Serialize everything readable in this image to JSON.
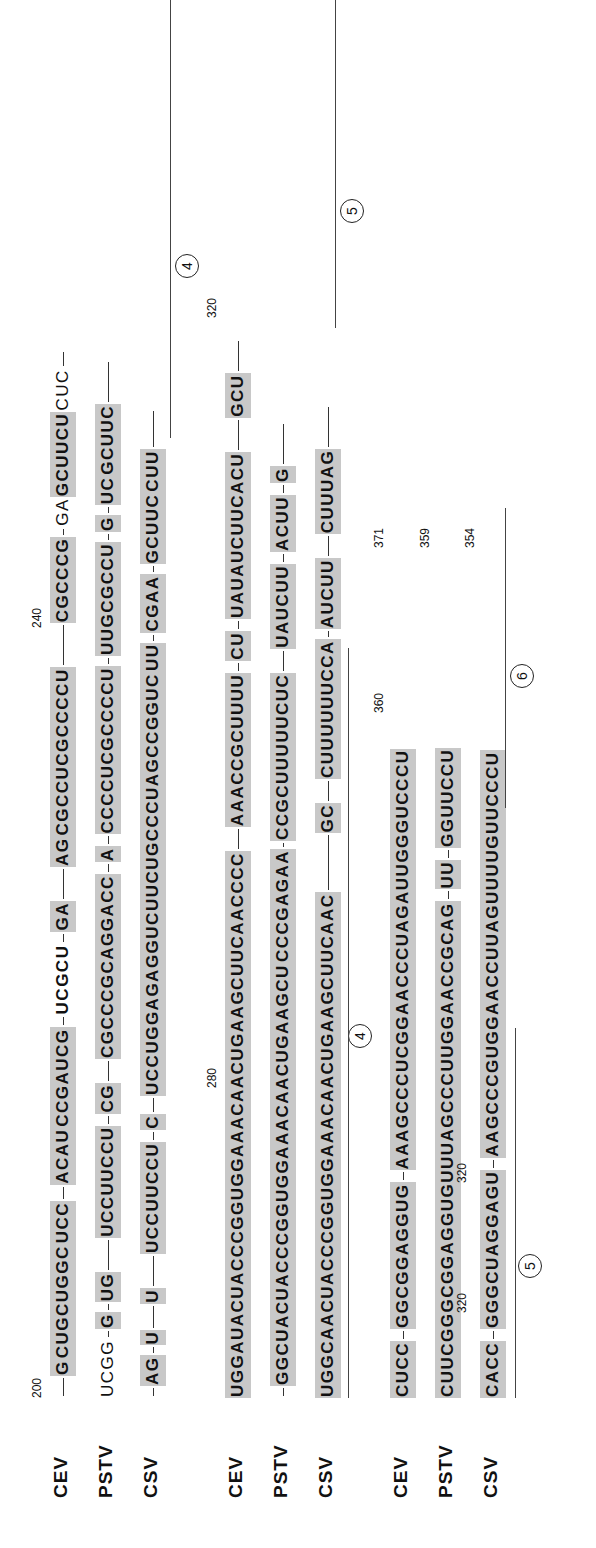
{
  "figure": {
    "type": "RNA sequence alignment (viroid)",
    "orientation": "rotated 90 degrees counter-clockwise",
    "species": [
      "CEV",
      "PSTV",
      "CSV"
    ],
    "blocks": [
      {
        "rows": [
          {
            "label": "CEV",
            "segments": [
              "G",
              "CUGCUGGC",
              "UCC",
              "ACAU",
              "CCGAUCG",
              "UCGCU",
              "GA",
              "AG",
              "CGCCUCGCCCCU",
              "CGCCCG",
              "GA",
              "GCUUCU",
              "CUC"
            ]
          },
          {
            "label": "PSTV",
            "segments": [
              "UCGG",
              "G",
              "UG",
              "UCCUUCCU",
              "CG",
              "CGCCCGCAGGACC",
              "A",
              "CCCCUCGCCCCU",
              "UUGCGCCU",
              "G",
              "UC",
              "GCUUC"
            ]
          },
          {
            "label": "CSV",
            "segments": [
              "AG",
              "U",
              "U",
              "UCCUUCCU",
              "C",
              "UCCUGGAGAGGUCUUCUGCCCUAGCCGGUC",
              "UU",
              "CGAA",
              "GCUUC",
              "CUU"
            ]
          }
        ],
        "numbers": [
          "200",
          "200",
          "200",
          "240",
          "240",
          "240"
        ],
        "region_marks": [
          "4"
        ]
      },
      {
        "rows": [
          {
            "label": "CEV",
            "segments": [
              "UGGAUACUACCCGGUGGAAACAACUGAAGCUUCAACCCC",
              "AAACCGCUUUU",
              "CU",
              "UAUAUCUUCACU",
              "GCU"
            ]
          },
          {
            "label": "PSTV",
            "segments": [
              "GGCUACUACCCGGUGGAAACAACUGAAGCU",
              "CCCGAGAA",
              "CCGCUUUUUCUC",
              "UAUCUU",
              "ACUU",
              "G"
            ]
          },
          {
            "label": "CSV",
            "segments": [
              "UGGCAACUACCCGGUGGAAACAACUGAAGCUUCAAC",
              "GC",
              "CUUUUUUCCA",
              "AUCUU",
              "CUUUAG"
            ]
          }
        ],
        "numbers": [
          "280",
          "280",
          "280",
          "320"
        ],
        "region_marks": [
          "4",
          "5"
        ]
      },
      {
        "rows": [
          {
            "label": "CEV",
            "segments": [
              "CUCC",
              "GGCGGAGGUG",
              "AAAGCCCUCGGAACCCUAGAUUGGGUCCCU"
            ]
          },
          {
            "label": "PSTV",
            "segments": [
              "CUUCGGGCGGAGGUGUUUAGCCCUUGGAACCGCAG",
              "UU",
              "GGUUCCU"
            ]
          },
          {
            "label": "CSV",
            "segments": [
              "CACC",
              "GGGCUAGGAGU",
              "AAGCCCGUGGAACCUUAGUUUUGUUCCCU"
            ]
          }
        ],
        "numbers": [
          "320",
          "320",
          "320",
          "360",
          "371",
          "359",
          "354"
        ],
        "region_marks": [
          "5",
          "6"
        ]
      }
    ]
  }
}
